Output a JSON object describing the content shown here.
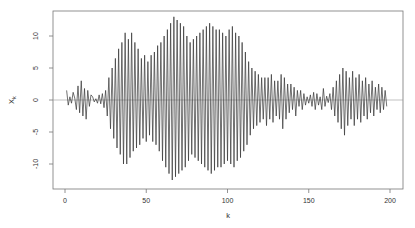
{
  "chart_data": {
    "type": "line",
    "title": "",
    "xlabel": "k",
    "ylabel": "X_k",
    "xlim": [
      0,
      200
    ],
    "ylim": [
      -14,
      14
    ],
    "xticks": [
      0,
      50,
      100,
      150,
      200
    ],
    "yticks": [
      -10,
      -5,
      0,
      5,
      10
    ],
    "grid": false,
    "reference_line": 0,
    "legend": null,
    "series": [
      {
        "name": "X_k",
        "x_start": 1,
        "values": [
          1.5,
          -0.8,
          0.5,
          -0.5,
          1.2,
          0.3,
          -1.5,
          2.2,
          -2,
          3,
          -2.5,
          1.8,
          -3,
          1.5,
          -1,
          0.8,
          0.5,
          -0.3,
          0.2,
          -0.5,
          0.8,
          -0.6,
          1,
          -1.2,
          1.5,
          -2.5,
          3.5,
          -4.5,
          5,
          -6,
          6.5,
          -7.5,
          8,
          -8.5,
          9,
          -10,
          10.5,
          -10,
          9.5,
          -9,
          10.5,
          -8,
          9,
          -7.5,
          8,
          -7,
          6.5,
          -6,
          7,
          -6.5,
          6,
          -5.5,
          7,
          -6.5,
          7.5,
          -7,
          8.5,
          -8,
          9,
          -9.5,
          10,
          -10.5,
          11,
          -11.5,
          12,
          -12.5,
          13,
          -12,
          12.5,
          -11.5,
          12,
          -11,
          11.5,
          -10.5,
          10,
          -9.5,
          9,
          -8.5,
          9.5,
          -9,
          10,
          -9.5,
          10.5,
          -10,
          11,
          -10.5,
          11.5,
          -11,
          12,
          -11.5,
          11.5,
          -11,
          11,
          -10.5,
          11,
          -10.5,
          10.5,
          -10,
          10,
          -9.5,
          11,
          -10,
          11.5,
          -10.5,
          10.5,
          -9.5,
          10,
          -9,
          9,
          -8,
          7.5,
          -7,
          6,
          -5.5,
          5,
          -4.5,
          4.5,
          -4,
          4,
          -3.5,
          3.5,
          -3,
          3.5,
          -4,
          3.5,
          -3,
          4,
          -3.5,
          3,
          -2.5,
          3,
          -3,
          4,
          -4.5,
          3.5,
          -3,
          2.5,
          -2,
          2.5,
          -1.5,
          2,
          -2.5,
          1.5,
          -1,
          1.5,
          -1.5,
          1,
          -0.8,
          0.5,
          -0.5,
          0.8,
          -1,
          1.2,
          -1.5,
          1,
          -0.8,
          0.5,
          -1.5,
          1.8,
          -1,
          0.6,
          -0.4,
          1,
          -1.5,
          2,
          -2.5,
          3,
          -3.5,
          4,
          -4.5,
          5,
          -5.5,
          4.5,
          -4,
          3.5,
          -3,
          4.5,
          -4,
          3.5,
          -3,
          4,
          -3.5,
          3,
          -2.5,
          3.5,
          -3,
          2.5,
          -2,
          3,
          -2.5,
          2,
          -1.5,
          2.5,
          -2,
          2,
          -1.5,
          1.5,
          -1
        ]
      }
    ]
  }
}
